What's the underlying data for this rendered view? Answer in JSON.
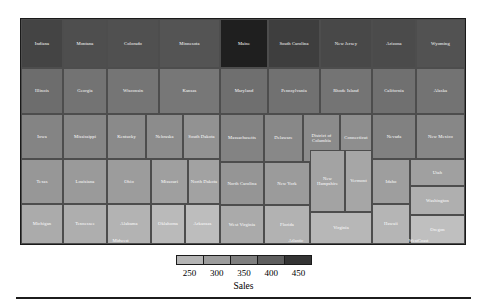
{
  "chart_data": {
    "type": "treemap",
    "title": "",
    "value_label": "Sales",
    "legend": {
      "title": "Sales",
      "ticks": [
        250,
        300,
        350,
        400,
        450
      ],
      "min": 225,
      "max": 475,
      "colors": [
        "#b5b5b5",
        "#9d9d9d",
        "#7f7f7f",
        "#5e5e5e",
        "#343434"
      ],
      "position": "bottom"
    },
    "groups": [
      {
        "name": "Midwest",
        "label_shown": true,
        "x": 0,
        "y": 0,
        "w": 199.0,
        "h": 225.0,
        "items": [
          {
            "name": "Indiana",
            "value": 415,
            "x": 0.0,
            "y": 0.0,
            "w": 42.0,
            "h": 49.0
          },
          {
            "name": "Montana",
            "value": 400,
            "x": 42.0,
            "y": 0.0,
            "w": 44.0,
            "h": 49.0
          },
          {
            "name": "Colorado",
            "value": 398,
            "x": 86.0,
            "y": 0.0,
            "w": 52.0,
            "h": 49.0
          },
          {
            "name": "Minnesota",
            "value": 392,
            "x": 138.0,
            "y": 0.0,
            "w": 61.0,
            "h": 49.0
          },
          {
            "name": "Illinois",
            "value": 355,
            "x": 0.0,
            "y": 49.0,
            "w": 42.0,
            "h": 46.0
          },
          {
            "name": "Georgia",
            "value": 345,
            "x": 42.0,
            "y": 49.0,
            "w": 44.0,
            "h": 46.0
          },
          {
            "name": "Wisconsin",
            "value": 342,
            "x": 86.0,
            "y": 49.0,
            "w": 52.0,
            "h": 46.0
          },
          {
            "name": "Kansas",
            "value": 340,
            "x": 138.0,
            "y": 49.0,
            "w": 61.0,
            "h": 46.0
          },
          {
            "name": "Iowa",
            "value": 320,
            "x": 0.0,
            "y": 95.0,
            "w": 42.0,
            "h": 45.0
          },
          {
            "name": "Mississippi",
            "value": 318,
            "x": 42.0,
            "y": 95.0,
            "w": 44.0,
            "h": 45.0
          },
          {
            "name": "Kentucky",
            "value": 312,
            "x": 86.0,
            "y": 95.0,
            "w": 39.0,
            "h": 45.0
          },
          {
            "name": "Nebraska",
            "value": 308,
            "x": 125.0,
            "y": 95.0,
            "w": 37.0,
            "h": 45.0
          },
          {
            "name": "South Dakota",
            "value": 300,
            "x": 162.0,
            "y": 95.0,
            "w": 37.0,
            "h": 45.0
          },
          {
            "name": "Texas",
            "value": 292,
            "x": 0.0,
            "y": 140.0,
            "w": 42.0,
            "h": 45.0
          },
          {
            "name": "Louisiana",
            "value": 288,
            "x": 42.0,
            "y": 140.0,
            "w": 44.0,
            "h": 45.0
          },
          {
            "name": "Ohio",
            "value": 285,
            "x": 86.0,
            "y": 140.0,
            "w": 44.0,
            "h": 45.0
          },
          {
            "name": "Missouri",
            "value": 280,
            "x": 130.0,
            "y": 140.0,
            "w": 37.0,
            "h": 45.0
          },
          {
            "name": "North Dakota",
            "value": 276,
            "x": 167.0,
            "y": 140.0,
            "w": 32.0,
            "h": 45.0
          },
          {
            "name": "Michigan",
            "value": 262,
            "x": 0.0,
            "y": 185.0,
            "w": 42.0,
            "h": 40.0
          },
          {
            "name": "Tennessee",
            "value": 258,
            "x": 42.0,
            "y": 185.0,
            "w": 44.0,
            "h": 40.0
          },
          {
            "name": "Alabama",
            "value": 250,
            "x": 86.0,
            "y": 185.0,
            "w": 44.0,
            "h": 40.0
          },
          {
            "name": "Oklahoma",
            "value": 240,
            "x": 130.0,
            "y": 185.0,
            "w": 34.0,
            "h": 40.0
          },
          {
            "name": "Arkansas",
            "value": 236,
            "x": 164.0,
            "y": 185.0,
            "w": 35.0,
            "h": 40.0
          }
        ]
      },
      {
        "name": "Atlantic",
        "label_shown": true,
        "x": 199.0,
        "y": 0,
        "w": 152.0,
        "h": 225.0,
        "items": [
          {
            "name": "Maine",
            "value": 470,
            "x": 0.0,
            "y": 0.0,
            "w": 48.0,
            "h": 49.0
          },
          {
            "name": "South Carolina",
            "value": 425,
            "x": 48.0,
            "y": 0.0,
            "w": 52.0,
            "h": 49.0
          },
          {
            "name": "New Jersey",
            "value": 410,
            "x": 100.0,
            "y": 0.0,
            "w": 52.0,
            "h": 49.0
          },
          {
            "name": "Maryland",
            "value": 352,
            "x": 0.0,
            "y": 49.0,
            "w": 48.0,
            "h": 46.0
          },
          {
            "name": "Pennsylvania",
            "value": 348,
            "x": 48.0,
            "y": 49.0,
            "w": 52.0,
            "h": 46.0
          },
          {
            "name": "Rhode Island",
            "value": 344,
            "x": 100.0,
            "y": 49.0,
            "w": 52.0,
            "h": 46.0
          },
          {
            "name": "Massachusetts",
            "value": 322,
            "x": 0.0,
            "y": 95.0,
            "w": 44.0,
            "h": 48.0
          },
          {
            "name": "Delaware",
            "value": 315,
            "x": 44.0,
            "y": 95.0,
            "w": 39.0,
            "h": 48.0
          },
          {
            "name": "District of Columbia",
            "value": 310,
            "x": 83.0,
            "y": 95.0,
            "w": 37.0,
            "h": 48.0
          },
          {
            "name": "Connecticut",
            "value": 305,
            "x": 120.0,
            "y": 95.0,
            "w": 32.0,
            "h": 48.0
          },
          {
            "name": "North Carolina",
            "value": 295,
            "x": 0.0,
            "y": 143.0,
            "w": 44.0,
            "h": 43.0
          },
          {
            "name": "New York",
            "value": 286,
            "x": 44.0,
            "y": 143.0,
            "w": 46.0,
            "h": 43.0
          },
          {
            "name": "New Hampshire",
            "value": 274,
            "x": 90.0,
            "y": 131.0,
            "w": 35.0,
            "h": 62.0
          },
          {
            "name": "Vermont",
            "value": 270,
            "x": 125.0,
            "y": 131.0,
            "w": 27.0,
            "h": 62.0
          },
          {
            "name": "West Virginia",
            "value": 264,
            "x": 0.0,
            "y": 186.0,
            "w": 44.0,
            "h": 39.0
          },
          {
            "name": "Florida",
            "value": 252,
            "x": 44.0,
            "y": 186.0,
            "w": 46.0,
            "h": 39.0
          },
          {
            "name": "Virginia",
            "value": 244,
            "x": 90.0,
            "y": 193.0,
            "w": 62.0,
            "h": 32.0
          }
        ]
      },
      {
        "name": "WestCoast",
        "label_shown": true,
        "x": 351.0,
        "y": 0,
        "w": 93.0,
        "h": 225.0,
        "items": [
          {
            "name": "Arizona",
            "value": 405,
            "x": 0.0,
            "y": 0.0,
            "w": 44.0,
            "h": 49.0
          },
          {
            "name": "Wyoming",
            "value": 395,
            "x": 44.0,
            "y": 0.0,
            "w": 49.0,
            "h": 49.0
          },
          {
            "name": "California",
            "value": 350,
            "x": 0.0,
            "y": 49.0,
            "w": 44.0,
            "h": 46.0
          },
          {
            "name": "Alaska",
            "value": 346,
            "x": 44.0,
            "y": 49.0,
            "w": 49.0,
            "h": 46.0
          },
          {
            "name": "Nevada",
            "value": 325,
            "x": 0.0,
            "y": 95.0,
            "w": 44.0,
            "h": 45.0
          },
          {
            "name": "New Mexico",
            "value": 316,
            "x": 44.0,
            "y": 95.0,
            "w": 49.0,
            "h": 45.0
          },
          {
            "name": "Idaho",
            "value": 282,
            "x": 0.0,
            "y": 140.0,
            "w": 38.0,
            "h": 45.0
          },
          {
            "name": "Utah",
            "value": 278,
            "x": 38.0,
            "y": 140.0,
            "w": 55.0,
            "h": 27.0
          },
          {
            "name": "Washington",
            "value": 256,
            "x": 38.0,
            "y": 167.0,
            "w": 55.0,
            "h": 29.0
          },
          {
            "name": "Hawaii",
            "value": 248,
            "x": 0.0,
            "y": 185.0,
            "w": 38.0,
            "h": 40.0
          },
          {
            "name": "Oregon",
            "value": 232,
            "x": 38.0,
            "y": 196.0,
            "w": 55.0,
            "h": 29.0
          }
        ]
      }
    ]
  }
}
